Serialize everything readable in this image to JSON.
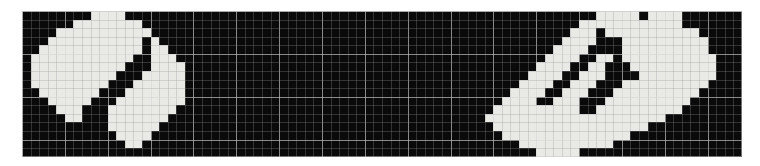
{
  "image": {
    "title": "Pixelated binary mosaic",
    "description": "Two bright pixel-art blob figures on a black grid background",
    "width_px": 760,
    "height_px": 166,
    "background_color": "#ffffff"
  },
  "grid": {
    "origin_x": 22,
    "origin_y": 11,
    "cols": 84,
    "rows": 17,
    "cell_size": 8.57,
    "on_color": "#e9e9e6",
    "off_color": "#0b0b0b",
    "surface_color": "#0a0a0a",
    "minor_line_color": "rgba(150,150,150,0.30)",
    "major_line_color": "rgba(215,215,215,0.62)",
    "major_every": 5,
    "border_color": "rgba(200,200,200,0.55)",
    "show_gridlines": true
  },
  "chart_data": {
    "type": "heatmap",
    "title": "Pixelated binary mosaic",
    "xlabel": "",
    "ylabel": "",
    "legend": [
      {
        "label": "on",
        "value": 1,
        "color": "#e9e9e6"
      },
      {
        "label": "off",
        "value": 0,
        "color": "#0b0b0b"
      }
    ],
    "cols": 84,
    "rows": 17,
    "values": [
      "000000001111000000000000000000000000000000000000000000000000000000011111011110000",
      "000000111111110000000000000000000000000000000000000000000000000001111111111110000",
      "000011111111111000000000000000000000000000000000000000000000000011101111111111100",
      "000111111111110100000000000000000000000000000000000000000000000111100011111111110",
      "001111111111110110000000000000000000000000000000000000000000001111000011111111110",
      "011111111111100111000000000000000000000000000000000000000000011110011011111111111",
      "011111111111000111100000000000000000000000000000000000000000111100110001111111111",
      "011111111110001111100000000000000000000000000000000000000001111001110000111111111",
      "011111111100011111100000000000000000000000000000000000000011110011100011111111110",
      "001111111000111111100000000000000000000000000000000000000111100111000111111111100",
      "000111110001111111100000000000000000000000000000000000001111001110001111111111000",
      "000011100011111111000000000000000000000000000000000000011111111110011111111110000",
      "000001100011111110000000000000000000000000000000000000111111111111111111111000000",
      "000000000011111100000000000000000000000000000000000000011111111111111111100000000",
      "000000000001111000000000000000000000000000000000000000001111111111111110000000000",
      "000000000000110000000000000000000000000000000000000000000011111111111000000000000",
      "000000000000000000000000000000000000000000000000000000000000111110000000000000000"
    ],
    "figures": [
      {
        "name": "left-figure",
        "col_start": 0,
        "col_end": 20,
        "description": "Circular bright blob with dark diagonal slash through center"
      },
      {
        "name": "right-figure",
        "col_start": 58,
        "col_end": 83,
        "description": "Rounded bright blob with dark angular notch on upper-left"
      }
    ]
  }
}
